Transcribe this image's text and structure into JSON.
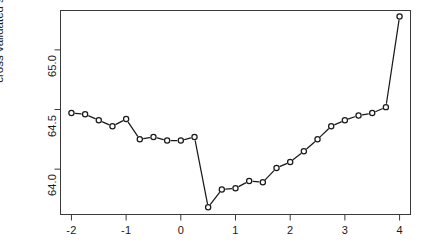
{
  "chart_data": {
    "type": "line",
    "title": "",
    "subtitle": "",
    "xlabel": "",
    "ylabel": "cross validated sum of squares",
    "xlim": [
      -2.2,
      4.2
    ],
    "ylim": [
      63.62,
      65.33
    ],
    "xticks": [
      -2,
      -1,
      0,
      1,
      2,
      3,
      4
    ],
    "xtick_labels": [
      "-2",
      "-1",
      "0",
      "1",
      "2",
      "3",
      "4"
    ],
    "yticks": [
      64.0,
      64.5,
      65.0
    ],
    "ytick_labels": [
      "64.0",
      "64.5",
      "65.0"
    ],
    "grid": false,
    "legend": null,
    "marker": "open-circle",
    "line_color": "#1a1a1a",
    "marker_color": "#1a1a1a",
    "series": [
      {
        "name": "cross validated sum of squares",
        "x": [
          -2.0,
          -1.75,
          -1.5,
          -1.25,
          -1.0,
          -0.75,
          -0.5,
          -0.25,
          0.0,
          0.25,
          0.5,
          0.75,
          1.0,
          1.25,
          1.5,
          1.75,
          2.0,
          2.25,
          2.5,
          2.75,
          3.0,
          3.25,
          3.5,
          3.75,
          4.0
        ],
        "y": [
          64.47,
          64.46,
          64.41,
          64.36,
          64.42,
          64.25,
          64.27,
          64.24,
          64.24,
          64.27,
          63.68,
          63.83,
          63.84,
          63.9,
          63.89,
          64.01,
          64.06,
          64.15,
          64.25,
          64.36,
          64.41,
          64.45,
          64.47,
          64.52,
          65.28
        ]
      }
    ]
  },
  "axis": {
    "y_title": "cross validated sum of squares"
  }
}
